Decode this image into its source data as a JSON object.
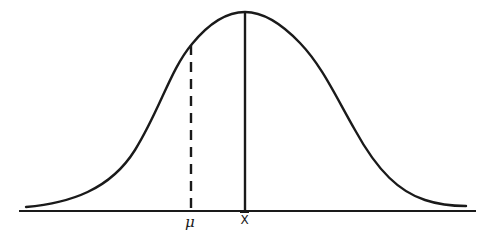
{
  "diagram": {
    "type": "normal-distribution-curve",
    "labels": {
      "mu": "μ",
      "xbar": "X"
    },
    "lines": {
      "population_mean": {
        "style": "dashed",
        "label": "μ"
      },
      "sample_mean": {
        "style": "solid",
        "label": "X̄"
      }
    },
    "colors": {
      "stroke": "#1a1a1a",
      "background": "#ffffff"
    }
  }
}
